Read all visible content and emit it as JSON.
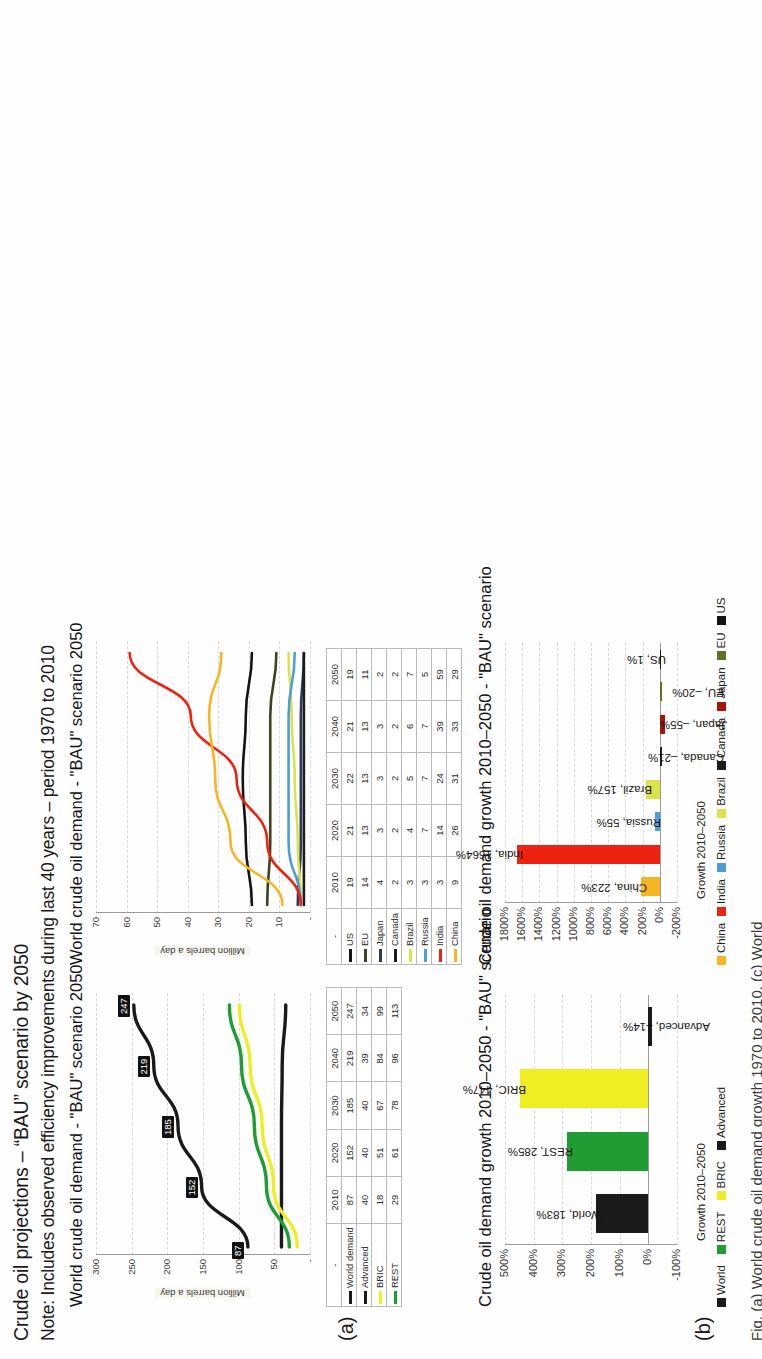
{
  "document": {
    "title": "Crude oil projections – “BAU” scenario by 2050",
    "note": "Note: Includes observed efficiency improvements during last 40 years – period 1970 to 2010",
    "bottom_caption_partial": "Fig. (a) World crude oil demand growth 1970 to 2010, (c) World"
  },
  "panel_a_label": "(a)",
  "panel_b_label": "(b)",
  "colors": {
    "world": "#1a1a1a",
    "advanced": "#1a1a1a",
    "bric": "#eeee22",
    "rest": "#1f9d33",
    "us": "#141414",
    "eu": "#3c4420",
    "japan": "#2b3a5c",
    "canada": "#1c1c1c",
    "brazil": "#dce34a",
    "russia": "#4d9ddb",
    "india": "#ee2211",
    "china": "#f6b522",
    "japan_bar": "#a81408",
    "eu_bar": "#5d7228",
    "grid": "#d8d8d8",
    "axis": "#9a9a9a"
  },
  "chart_a_line": {
    "type": "line",
    "title": "World crude oil demand  - \"BAU\" scenario 2050",
    "ylabel": "Million barrels a day",
    "yticks": [
      "300",
      "250",
      "200",
      "150",
      "100",
      "50",
      "-"
    ],
    "ylim": [
      0,
      300
    ],
    "categories": [
      "2010",
      "2020",
      "2030",
      "2040",
      "2050"
    ],
    "series": [
      {
        "name": "World demand",
        "color_key": "world",
        "values": [
          87,
          152,
          185,
          219,
          247
        ],
        "point_labels": [
          "87",
          "152",
          "185",
          "219",
          "247"
        ]
      },
      {
        "name": "Advanced",
        "color_key": "advanced",
        "values": [
          40,
          40,
          40,
          39,
          34
        ],
        "point_labels": []
      },
      {
        "name": "BRIC",
        "color_key": "bric",
        "values": [
          18,
          51,
          67,
          84,
          99
        ],
        "point_labels": []
      },
      {
        "name": "REST",
        "color_key": "rest",
        "values": [
          29,
          61,
          78,
          96,
          113
        ],
        "point_labels": []
      }
    ]
  },
  "table_a": {
    "corner": "-",
    "years": [
      "2010",
      "2020",
      "2030",
      "2040",
      "2050"
    ],
    "rows": [
      {
        "label": "World demand",
        "color_key": "world",
        "values": [
          "87",
          "152",
          "185",
          "219",
          "247"
        ]
      },
      {
        "label": "Advanced",
        "color_key": "advanced",
        "values": [
          "40",
          "40",
          "40",
          "39",
          "34"
        ]
      },
      {
        "label": "BRIC",
        "color_key": "bric",
        "values": [
          "18",
          "51",
          "67",
          "84",
          "99"
        ]
      },
      {
        "label": "REST",
        "color_key": "rest",
        "values": [
          "29",
          "61",
          "78",
          "96",
          "113"
        ]
      }
    ]
  },
  "chart_b_line": {
    "type": "line",
    "title": "World crude oil demand  - \"BAU\" scenario 2050",
    "ylabel": "Million barrels a day",
    "yticks": [
      "70",
      "60",
      "50",
      "40",
      "30",
      "20",
      "10",
      "-"
    ],
    "ylim": [
      0,
      70
    ],
    "categories": [
      "2010",
      "2020",
      "2030",
      "2040",
      "2050"
    ],
    "series": [
      {
        "name": "US",
        "color_key": "us",
        "values": [
          19,
          21,
          22,
          21,
          19
        ]
      },
      {
        "name": "EU",
        "color_key": "eu",
        "values": [
          14,
          13,
          13,
          13,
          11
        ]
      },
      {
        "name": "Japan",
        "color_key": "japan",
        "values": [
          4,
          3,
          3,
          3,
          2
        ]
      },
      {
        "name": "Canada",
        "color_key": "canada",
        "values": [
          2,
          2,
          2,
          2,
          2
        ]
      },
      {
        "name": "Brazil",
        "color_key": "brazil",
        "values": [
          3,
          4,
          5,
          6,
          7
        ]
      },
      {
        "name": "Russia",
        "color_key": "russia",
        "values": [
          3,
          7,
          7,
          7,
          5
        ]
      },
      {
        "name": "India",
        "color_key": "india",
        "values": [
          3,
          14,
          24,
          39,
          59
        ]
      },
      {
        "name": "China",
        "color_key": "china",
        "values": [
          9,
          26,
          31,
          33,
          29
        ]
      }
    ]
  },
  "table_b": {
    "corner": "-",
    "years": [
      "2010",
      "2020",
      "2030",
      "2040",
      "2050"
    ],
    "rows": [
      {
        "label": "US",
        "color_key": "us",
        "values": [
          "19",
          "21",
          "22",
          "21",
          "19"
        ]
      },
      {
        "label": "EU",
        "color_key": "eu",
        "values": [
          "14",
          "13",
          "13",
          "13",
          "11"
        ]
      },
      {
        "label": "Japan",
        "color_key": "japan",
        "values": [
          "4",
          "3",
          "3",
          "3",
          "2"
        ]
      },
      {
        "label": "Canada",
        "color_key": "canada",
        "values": [
          "2",
          "2",
          "2",
          "2",
          "2"
        ]
      },
      {
        "label": "Brazil",
        "color_key": "brazil",
        "values": [
          "3",
          "4",
          "5",
          "6",
          "7"
        ]
      },
      {
        "label": "Russia",
        "color_key": "russia",
        "values": [
          "3",
          "7",
          "7",
          "7",
          "5"
        ]
      },
      {
        "label": "India",
        "color_key": "india",
        "values": [
          "3",
          "14",
          "24",
          "39",
          "59"
        ]
      },
      {
        "label": "China",
        "color_key": "china",
        "values": [
          "9",
          "26",
          "31",
          "33",
          "29"
        ]
      }
    ]
  },
  "chart_c_bar": {
    "type": "bar",
    "title": "Crude oil demand  growth 2010–2050 - \"BAU\" scenario",
    "axis_caption": "Growth 2010–2050",
    "xticks": [
      "-100%",
      "0%",
      "100%",
      "200%",
      "300%",
      "400%",
      "500%"
    ],
    "ylim": [
      -100,
      500
    ],
    "categories": [
      "World",
      "REST",
      "BRIC",
      "Advanced"
    ],
    "values": [
      183,
      285,
      447,
      -14
    ],
    "data_labels": [
      "World, 183%",
      "REST, 285%",
      "BRIC, 447%",
      "Advanced, –14%"
    ],
    "colors": [
      "#1a1a1a",
      "#1f9d33",
      "#eeee22",
      "#1a1a1a"
    ],
    "legend": [
      {
        "label": "World",
        "color": "#1a1a1a"
      },
      {
        "label": "REST",
        "color": "#1f9d33"
      },
      {
        "label": "BRIC",
        "color": "#eeee22"
      },
      {
        "label": "Advanced",
        "color": "#1a1a1a"
      }
    ]
  },
  "chart_d_bar": {
    "type": "bar",
    "title": "Crude oil demand  growth 2010–2050 - \"BAU\" scenario",
    "axis_caption": "Growth 2010–2050",
    "xticks": [
      "-200%",
      "0%",
      "200%",
      "400%",
      "600%",
      "800%",
      "1000%",
      "1200%",
      "1400%",
      "1600%",
      "1800%"
    ],
    "ylim": [
      -200,
      1800
    ],
    "categories": [
      "China",
      "India",
      "Russia",
      "Brazil",
      "Canada",
      "Japan",
      "EU",
      "US"
    ],
    "values": [
      223,
      1664,
      55,
      157,
      -21,
      -55,
      -20,
      1
    ],
    "data_labels": [
      "China, 223%",
      "India, 1664%",
      "Russia, 55%",
      "Brazil, 157%",
      "Canada, –21%",
      "Japan, –55%",
      "EU, –20%",
      "US, 1%"
    ],
    "colors": [
      "#f6b522",
      "#ee2211",
      "#4d9ddb",
      "#dce34a",
      "#1c1c1c",
      "#a81408",
      "#5d7228",
      "#141414"
    ],
    "legend": [
      {
        "label": "China",
        "color": "#f6b522"
      },
      {
        "label": "India",
        "color": "#ee2211"
      },
      {
        "label": "Russia",
        "color": "#4d9ddb"
      },
      {
        "label": "Brazil",
        "color": "#dce34a"
      },
      {
        "label": "Canada",
        "color": "#1c1c1c"
      },
      {
        "label": "Japan",
        "color": "#a81408"
      },
      {
        "label": "EU",
        "color": "#5d7228"
      },
      {
        "label": "US",
        "color": "#141414"
      }
    ]
  }
}
